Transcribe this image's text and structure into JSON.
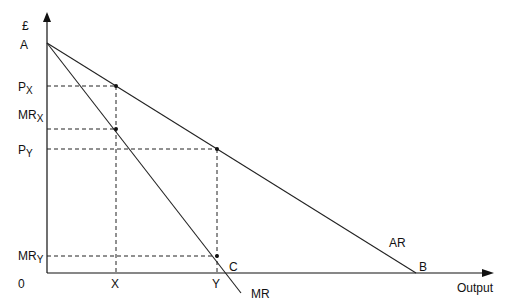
{
  "diagram": {
    "y_axis_label": "£",
    "x_axis_label": "Output",
    "origin_label": "0",
    "points": {
      "A": "A",
      "B": "B",
      "C": "C"
    },
    "curves": {
      "ar": "AR",
      "mr": "MR"
    },
    "y_ticks": {
      "px_main": "P",
      "px_sub": "X",
      "mrx_main": "MR",
      "mrx_sub": "X",
      "py_main": "P",
      "py_sub": "Y",
      "mry_main": "MR",
      "mry_sub": "Y"
    },
    "x_ticks": {
      "x": "X",
      "y": "Y"
    }
  }
}
